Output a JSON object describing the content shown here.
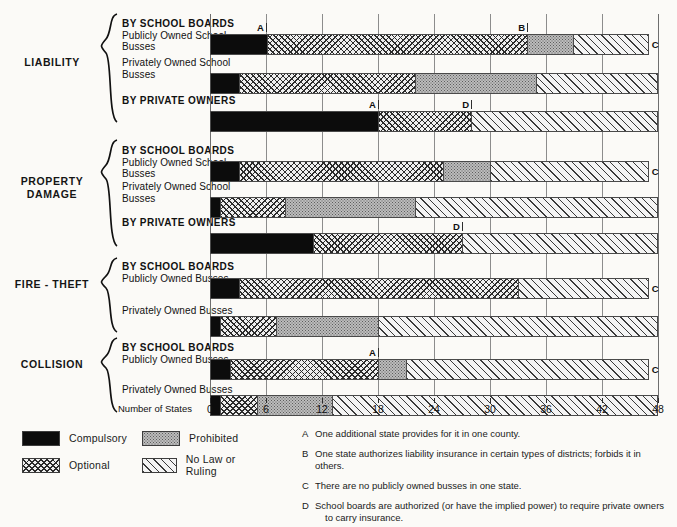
{
  "axis": {
    "name": "Number of States",
    "ticks": [
      0,
      6,
      12,
      18,
      24,
      30,
      36,
      42,
      48
    ],
    "min": 0,
    "max": 48
  },
  "groups": [
    {
      "name": "LIABILITY",
      "rows": [
        {
          "bold": "BY SCHOOL BOARDS",
          "sub": "Publicly Owned School\nBusses"
        },
        {
          "bold": "",
          "sub": "Privately Owned School\nBusses"
        },
        {
          "bold": "BY PRIVATE OWNERS",
          "sub": ""
        }
      ]
    },
    {
      "name": "PROPERTY\nDAMAGE",
      "rows": [
        {
          "bold": "BY SCHOOL BOARDS",
          "sub": "Publicly Owned School\nBusses"
        },
        {
          "bold": "",
          "sub": "Privately Owned School\nBusses"
        },
        {
          "bold": "BY PRIVATE OWNERS",
          "sub": ""
        }
      ]
    },
    {
      "name": "FIRE - THEFT",
      "rows": [
        {
          "bold": "BY SCHOOL BOARDS",
          "sub": "Publicly Owned Busses"
        },
        {
          "bold": "",
          "sub": "Privately Owned Busses"
        }
      ]
    },
    {
      "name": "COLLISION",
      "rows": [
        {
          "bold": "BY SCHOOL BOARDS",
          "sub": "Publicly Owned Busses"
        },
        {
          "bold": "",
          "sub": "Privately Owned Busses"
        }
      ]
    }
  ],
  "legend": [
    {
      "key": "compulsory",
      "label": "Compulsory"
    },
    {
      "key": "prohibited",
      "label": "Prohibited"
    },
    {
      "key": "optional",
      "label": "Optional"
    },
    {
      "key": "nolaw",
      "label": "No Law or Ruling"
    }
  ],
  "footnotes": [
    {
      "key": "A",
      "text": "One additional state provides for it in one county.",
      "cont": ""
    },
    {
      "key": "B",
      "text": "One state authorizes liability insurance in certain types of districts; forbids it in others.",
      "cont": ""
    },
    {
      "key": "C",
      "text": "There are no publicly owned busses in one state.",
      "cont": ""
    },
    {
      "key": "D",
      "text": "School boards are authorized (or have the implied power) to require private owners",
      "cont": "to carry insurance."
    }
  ],
  "colors": {
    "compulsory": "#0c0c0c",
    "optional": "#efefef",
    "prohibited": "#bcbcbc",
    "nolaw": "#f4f4f4",
    "rule": "#4a4a4a"
  },
  "chart_data": {
    "type": "bar",
    "orientation": "horizontal",
    "stacked": true,
    "title": "",
    "xlabel": "Number of States",
    "ylabel": "",
    "xlim": [
      0,
      48
    ],
    "xticks": [
      0,
      6,
      12,
      18,
      24,
      30,
      36,
      42,
      48
    ],
    "grid": "vertical",
    "legend_position": "bottom-left",
    "series": [
      {
        "name": "Compulsory",
        "values": [
          6,
          3,
          18,
          3,
          1,
          11,
          3,
          1,
          2,
          1
        ]
      },
      {
        "name": "Optional",
        "values": [
          28,
          19,
          10,
          22,
          7,
          16,
          30,
          6,
          16,
          4
        ]
      },
      {
        "name": "Prohibited",
        "values": [
          5,
          13,
          0,
          5,
          14,
          0,
          0,
          11,
          3,
          8
        ]
      },
      {
        "name": "No Law or Ruling",
        "values": [
          8,
          13,
          20,
          17,
          26,
          21,
          14,
          30,
          26,
          35
        ]
      }
    ],
    "categories": [
      "LIABILITY - BY SCHOOL BOARDS, Publicly Owned School Busses",
      "LIABILITY - Privately Owned School Busses",
      "LIABILITY - BY PRIVATE OWNERS",
      "PROPERTY DAMAGE - BY SCHOOL BOARDS, Publicly Owned School Busses",
      "PROPERTY DAMAGE - Privately Owned School Busses",
      "PROPERTY DAMAGE - BY PRIVATE OWNERS",
      "FIRE - THEFT - BY SCHOOL BOARDS, Publicly Owned Busses",
      "FIRE - THEFT - Privately Owned Busses",
      "COLLISION - BY SCHOOL BOARDS, Publicly Owned Busses",
      "COLLISION - Privately Owned Busses"
    ],
    "annotations": [
      {
        "label": "A",
        "row": 0,
        "value": 6
      },
      {
        "label": "B",
        "row": 0,
        "value": 34
      },
      {
        "label": "C",
        "row": 0,
        "value": 47
      },
      {
        "label": "A",
        "row": 2,
        "value": 18
      },
      {
        "label": "D",
        "row": 2,
        "value": 28
      },
      {
        "label": "C",
        "row": 3,
        "value": 47
      },
      {
        "label": "D",
        "row": 5,
        "value": 27
      },
      {
        "label": "C",
        "row": 6,
        "value": 47
      },
      {
        "label": "A",
        "row": 8,
        "value": 18
      },
      {
        "label": "C",
        "row": 8,
        "value": 47
      }
    ]
  },
  "bars": [
    {
      "top": 20,
      "segs": [
        {
          "f": "compulsory",
          "v": 6
        },
        {
          "f": "optional",
          "v": 28
        },
        {
          "f": "prohibited",
          "v": 5
        },
        {
          "f": "nolaw",
          "v": 8
        }
      ]
    },
    {
      "top": 59,
      "segs": [
        {
          "f": "compulsory",
          "v": 3
        },
        {
          "f": "optional",
          "v": 19
        },
        {
          "f": "prohibited",
          "v": 13
        },
        {
          "f": "nolaw",
          "v": 13
        }
      ]
    },
    {
      "top": 97,
      "segs": [
        {
          "f": "compulsory",
          "v": 18
        },
        {
          "f": "optional",
          "v": 10
        },
        {
          "f": "nolaw",
          "v": 20
        }
      ]
    },
    {
      "top": 147,
      "segs": [
        {
          "f": "compulsory",
          "v": 3
        },
        {
          "f": "optional",
          "v": 22
        },
        {
          "f": "prohibited",
          "v": 5
        },
        {
          "f": "nolaw",
          "v": 17
        }
      ]
    },
    {
      "top": 183,
      "segs": [
        {
          "f": "compulsory",
          "v": 1
        },
        {
          "f": "optional",
          "v": 7
        },
        {
          "f": "prohibited",
          "v": 14
        },
        {
          "f": "nolaw",
          "v": 26
        }
      ]
    },
    {
      "top": 219,
      "segs": [
        {
          "f": "compulsory",
          "v": 11
        },
        {
          "f": "optional",
          "v": 16
        },
        {
          "f": "nolaw",
          "v": 21
        }
      ]
    },
    {
      "top": 264,
      "segs": [
        {
          "f": "compulsory",
          "v": 3
        },
        {
          "f": "optional",
          "v": 30
        },
        {
          "f": "nolaw",
          "v": 14
        }
      ]
    },
    {
      "top": 302,
      "segs": [
        {
          "f": "compulsory",
          "v": 1
        },
        {
          "f": "optional",
          "v": 6
        },
        {
          "f": "prohibited",
          "v": 11
        },
        {
          "f": "nolaw",
          "v": 30
        }
      ]
    },
    {
      "top": 345,
      "segs": [
        {
          "f": "compulsory",
          "v": 2
        },
        {
          "f": "optional",
          "v": 16
        },
        {
          "f": "prohibited",
          "v": 3
        },
        {
          "f": "nolaw",
          "v": 26
        }
      ]
    },
    {
      "top": 381,
      "segs": [
        {
          "f": "compulsory",
          "v": 1
        },
        {
          "f": "optional",
          "v": 4
        },
        {
          "f": "prohibited",
          "v": 8
        },
        {
          "f": "nolaw",
          "v": 35
        }
      ]
    }
  ]
}
